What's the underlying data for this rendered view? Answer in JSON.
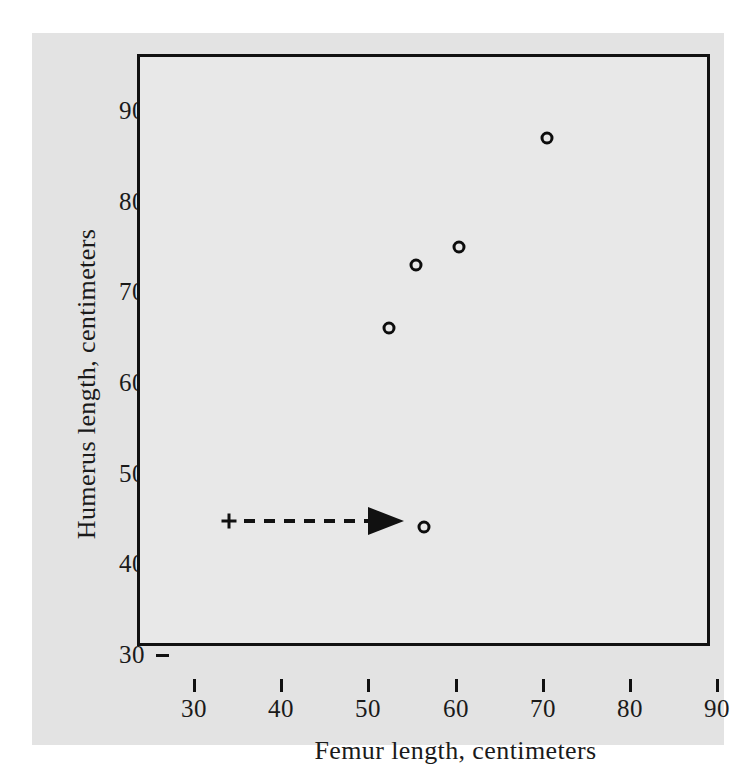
{
  "chart_data": {
    "type": "scatter",
    "title": "",
    "xlabel": "Femur length, centimeters",
    "ylabel": "Humerus length, centimeters",
    "xlim": [
      27.5,
      93
    ],
    "ylim": [
      27.5,
      93
    ],
    "xticks": [
      30,
      40,
      50,
      60,
      70,
      80,
      90
    ],
    "yticks": [
      30,
      40,
      50,
      60,
      70,
      80,
      90
    ],
    "xticklabels": [
      "30",
      "40",
      "50",
      "60",
      "70",
      "80",
      "90"
    ],
    "yticklabels": [
      "30",
      "40",
      "50",
      "60",
      "70",
      "80",
      "90"
    ],
    "grid": false,
    "legend": null,
    "marker": "open-circle",
    "points": [
      {
        "x": 38,
        "y": 41,
        "marker": "plus",
        "name": "annotation-start-marker"
      },
      {
        "x": 60,
        "y": 41,
        "marker": "open-circle",
        "name": "highlighted-point"
      },
      {
        "x": 56,
        "y": 63,
        "marker": "open-circle",
        "name": "data-point"
      },
      {
        "x": 59,
        "y": 70,
        "marker": "open-circle",
        "name": "data-point"
      },
      {
        "x": 64,
        "y": 72,
        "marker": "open-circle",
        "name": "data-point"
      },
      {
        "x": 74,
        "y": 84,
        "marker": "open-circle",
        "name": "data-point"
      }
    ],
    "series": [
      {
        "name": "Archaeopteryx specimens",
        "x": [
          56,
          59,
          64,
          60,
          74
        ],
        "y": [
          63,
          70,
          72,
          41,
          84
        ]
      }
    ],
    "annotations": [
      {
        "type": "dashed-arrow",
        "from_x": 38,
        "from_y": 41,
        "to_x": 60,
        "to_y": 41,
        "start_marker": "plus",
        "end_marker": "arrowhead",
        "style": "dashed"
      }
    ],
    "colors": {
      "marker": "#0d0d0d",
      "axis": "#111111",
      "plot_background": "#e8e8e8",
      "figure_background": "#e3e3e3",
      "page_background": "#ffffff",
      "text": "#1a1a1a"
    }
  }
}
